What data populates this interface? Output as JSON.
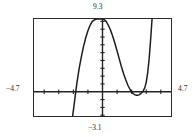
{
  "graph": {
    "labels": {
      "top": "9.3",
      "bottom": "−3.1",
      "left": "−4.7",
      "right": "4.7"
    },
    "colors": {
      "frame": "#2b2b2b",
      "axis": "#222222",
      "curve": "#1b1b1b",
      "background": "#ffffff"
    }
  },
  "chart_data": {
    "type": "line",
    "title": "",
    "xlabel": "",
    "ylabel": "",
    "xlim": [
      -4.7,
      4.7
    ],
    "ylim": [
      -3.1,
      9.3
    ],
    "grid": false,
    "legend": null,
    "axis_tick_spacing": {
      "x": 1,
      "y": 1
    },
    "annotations": [
      {
        "text": "9.3",
        "position": "top",
        "value": 9.3
      },
      {
        "text": "-3.1",
        "position": "bottom",
        "value": -3.1
      },
      {
        "text": "-4.7",
        "position": "left",
        "value": -4.7
      },
      {
        "text": "4.7",
        "position": "right",
        "value": 4.7
      }
    ],
    "features": {
      "local_maximum": {
        "x": 0.0,
        "y": 9.3
      },
      "local_minimum": {
        "x": 2.4,
        "y": -0.45
      },
      "x_intercepts": [
        -1.85,
        2.0,
        2.85
      ]
    },
    "series": [
      {
        "name": "curve",
        "x": [
          -2.05,
          -1.95,
          -1.85,
          -1.75,
          -1.6,
          -1.45,
          -1.3,
          -1.15,
          -1.0,
          -0.85,
          -0.7,
          -0.55,
          -0.4,
          -0.25,
          -0.1,
          0.0,
          0.1,
          0.25,
          0.4,
          0.55,
          0.7,
          0.85,
          1.0,
          1.15,
          1.3,
          1.45,
          1.6,
          1.75,
          1.9,
          2.0,
          2.1,
          2.2,
          2.3,
          2.4,
          2.5,
          2.6,
          2.7,
          2.8,
          2.9,
          3.0,
          3.1,
          3.2,
          3.3,
          3.4
        ],
        "y": [
          -3.1,
          -1.7,
          -0.2,
          1.2,
          3.0,
          4.5,
          5.8,
          6.9,
          7.8,
          8.5,
          9.0,
          9.2,
          9.3,
          9.3,
          9.3,
          9.3,
          9.25,
          9.0,
          8.5,
          7.9,
          7.1,
          6.2,
          5.2,
          4.2,
          3.2,
          2.3,
          1.5,
          0.8,
          0.25,
          0.0,
          -0.22,
          -0.36,
          -0.44,
          -0.45,
          -0.4,
          -0.28,
          -0.1,
          0.15,
          0.5,
          1.2,
          2.4,
          4.2,
          6.6,
          9.3
        ]
      }
    ]
  }
}
